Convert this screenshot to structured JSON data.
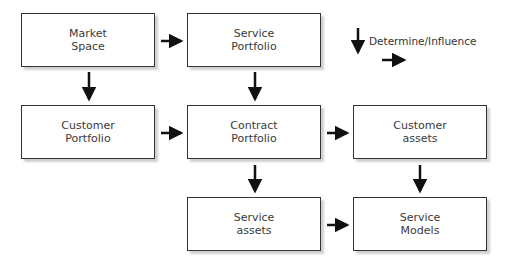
{
  "diagram": {
    "nodes": [
      {
        "id": "market-space",
        "label": "Market\nSpace",
        "x": 21,
        "y": 13
      },
      {
        "id": "service-portfolio",
        "label": "Service\nPortfolio",
        "x": 187,
        "y": 13
      },
      {
        "id": "customer-portfolio",
        "label": "Customer\nPortfolio",
        "x": 21,
        "y": 105
      },
      {
        "id": "contract-portfolio",
        "label": "Contract\nPortfolio",
        "x": 187,
        "y": 105
      },
      {
        "id": "customer-assets",
        "label": "Customer\nassets",
        "x": 353,
        "y": 105
      },
      {
        "id": "service-assets",
        "label": "Service\nassets",
        "x": 187,
        "y": 197
      },
      {
        "id": "service-models",
        "label": "Service\nModels",
        "x": 353,
        "y": 197
      }
    ],
    "edges": [
      {
        "from": "market-space",
        "to": "service-portfolio"
      },
      {
        "from": "market-space",
        "to": "customer-portfolio"
      },
      {
        "from": "service-portfolio",
        "to": "contract-portfolio"
      },
      {
        "from": "customer-portfolio",
        "to": "contract-portfolio"
      },
      {
        "from": "contract-portfolio",
        "to": "customer-assets"
      },
      {
        "from": "contract-portfolio",
        "to": "service-assets"
      },
      {
        "from": "customer-assets",
        "to": "service-models"
      },
      {
        "from": "service-assets",
        "to": "service-models"
      }
    ],
    "legend": {
      "label": "Determine/Influence"
    }
  }
}
